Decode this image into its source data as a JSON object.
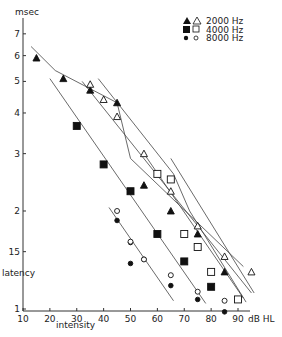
{
  "chart_data": {
    "type": "scatter",
    "title": "",
    "xlabel": "intensity",
    "x_unit": "dB HL",
    "ylabel": "latency",
    "y_unit": "msec",
    "y_scale": "log",
    "xlim": [
      10,
      95
    ],
    "ylim": [
      1,
      7.5
    ],
    "x_ticks": [
      10,
      20,
      30,
      40,
      50,
      60,
      70,
      80,
      90
    ],
    "x_tick_labels": [
      "10",
      "20",
      "30",
      "40",
      "50",
      "60",
      "70",
      "80",
      "90"
    ],
    "y_ticks": [
      1,
      1.5,
      2,
      3,
      4,
      5,
      6,
      7
    ],
    "y_tick_labels": [
      "1",
      "15",
      "2",
      "3",
      "4",
      "5",
      "6",
      "7"
    ],
    "grid": false,
    "legend_position": "top-right",
    "legend": [
      {
        "label": "2000 Hz",
        "filled_marker": "triangle",
        "open_marker": "triangle"
      },
      {
        "label": "4000 Hz",
        "filled_marker": "square",
        "open_marker": "square"
      },
      {
        "label": "8000 Hz",
        "filled_marker": "circle",
        "open_marker": "circle"
      }
    ],
    "series": [
      {
        "name": "2000 Hz (filled)",
        "marker": "triangle",
        "filled": true,
        "x": [
          15,
          25,
          35,
          45,
          55,
          65,
          75,
          85
        ],
        "y": [
          5.9,
          5.1,
          4.7,
          4.3,
          2.4,
          2.0,
          1.7,
          1.3
        ]
      },
      {
        "name": "2000 Hz (open)",
        "marker": "triangle",
        "filled": false,
        "x": [
          35,
          40,
          45,
          55,
          65,
          75,
          85,
          95
        ],
        "y": [
          4.9,
          4.4,
          3.9,
          3.0,
          2.3,
          1.8,
          1.45,
          1.3
        ]
      },
      {
        "name": "4000 Hz (filled)",
        "marker": "square",
        "filled": true,
        "x": [
          30,
          40,
          50,
          60,
          70,
          80
        ],
        "y": [
          3.65,
          2.78,
          2.3,
          1.7,
          1.4,
          1.17
        ]
      },
      {
        "name": "4000 Hz (open)",
        "marker": "square",
        "filled": false,
        "x": [
          60,
          65,
          70,
          75,
          80,
          90
        ],
        "y": [
          2.6,
          2.5,
          1.7,
          1.55,
          1.3,
          1.07
        ]
      },
      {
        "name": "8000 Hz (filled)",
        "marker": "circle",
        "filled": true,
        "x": [
          45,
          50,
          50,
          55,
          65,
          75,
          85
        ],
        "y": [
          1.87,
          1.6,
          1.38,
          1.42,
          1.18,
          1.07,
          0.98
        ]
      },
      {
        "name": "8000 Hz (open)",
        "marker": "circle",
        "filled": false,
        "x": [
          45,
          50,
          55,
          65,
          75,
          85
        ],
        "y": [
          2.0,
          1.61,
          1.42,
          1.27,
          1.13,
          1.06
        ]
      }
    ],
    "fit_lines": [
      {
        "name": "2000 Hz filled fit (broken)",
        "points": [
          [
            13,
            6.4
          ],
          [
            22,
            5.4
          ],
          [
            45,
            4.3
          ],
          [
            50,
            2.9
          ],
          [
            92,
            1.35
          ]
        ]
      },
      {
        "name": "2000 Hz open fit",
        "points": [
          [
            32,
            5.0
          ],
          [
            95,
            1.12
          ]
        ]
      },
      {
        "name": "4000 Hz filled fit",
        "points": [
          [
            20,
            5.1
          ],
          [
            78,
            1.04
          ]
        ]
      },
      {
        "name": "4000 Hz open fit (broken)",
        "points": [
          [
            38,
            5.1
          ],
          [
            66,
            2.6
          ],
          [
            72,
            2.0
          ],
          [
            93,
            1.05
          ]
        ]
      },
      {
        "name": "4000 Hz open fit 2",
        "points": [
          [
            55,
            3.0
          ],
          [
            92,
            1.08
          ]
        ]
      },
      {
        "name": "8000 Hz fit",
        "points": [
          [
            42,
            2.05
          ],
          [
            66,
            1.06
          ]
        ]
      },
      {
        "name": "2000 Hz open fit 2",
        "points": [
          [
            65,
            2.9
          ],
          [
            96,
            1.12
          ]
        ]
      }
    ]
  },
  "axis": {
    "y_unit_label": "msec",
    "y_title": "latency",
    "x_title": "intensity",
    "x_unit_label": "dB HL"
  },
  "legend": {
    "row1": "2000  Hz",
    "row2": "4000  Hz",
    "row3": "8000  Hz"
  }
}
